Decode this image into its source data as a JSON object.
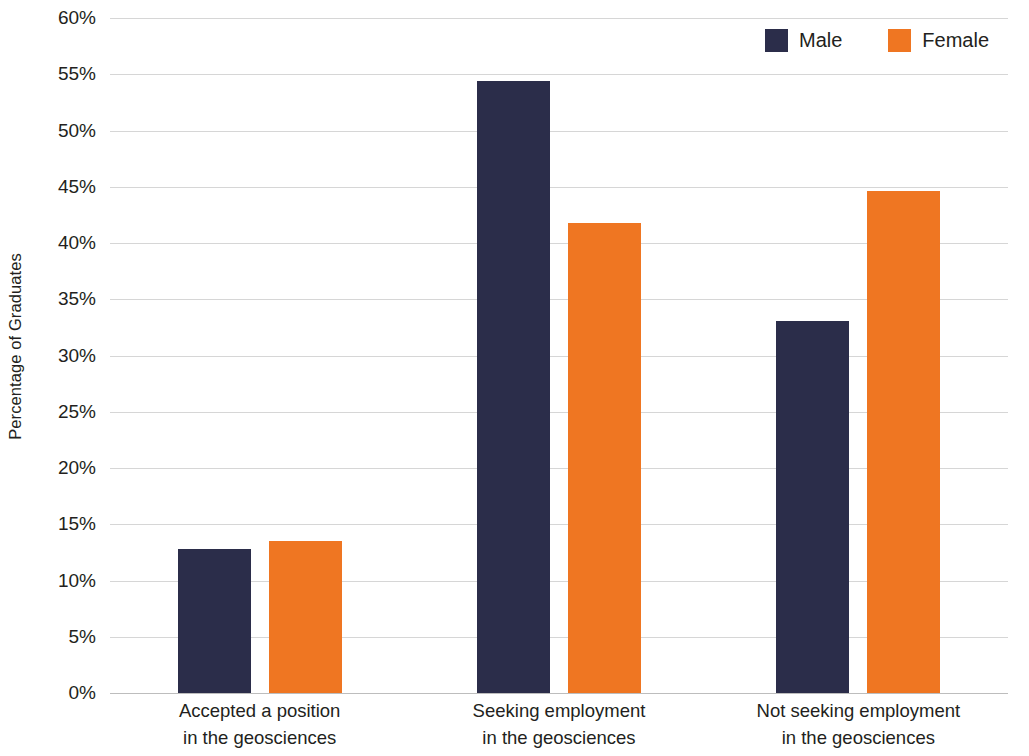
{
  "chart_data": {
    "type": "bar",
    "title": "",
    "xlabel": "",
    "ylabel": "Percentage of Graduates",
    "ylim": [
      0,
      60
    ],
    "ytick_step": 5,
    "ytick_labels": [
      "0%",
      "5%",
      "10%",
      "15%",
      "20%",
      "25%",
      "30%",
      "35%",
      "40%",
      "45%",
      "50%",
      "55%",
      "60%"
    ],
    "ytick_values": [
      0,
      5,
      10,
      15,
      20,
      25,
      30,
      35,
      40,
      45,
      50,
      55,
      60
    ],
    "grid": true,
    "legend_position": "top-right",
    "categories": [
      "Accepted a position in the geosciences",
      "Seeking employment in the geosciences",
      "Not seeking employment in the geosciences"
    ],
    "category_lines": [
      [
        "Accepted a position",
        "in the geosciences"
      ],
      [
        "Seeking employment",
        "in the geosciences"
      ],
      [
        "Not seeking employment",
        "in the geosciences"
      ]
    ],
    "series": [
      {
        "name": "Male",
        "color": "#2b2d4a",
        "values": [
          12.8,
          54.4,
          33.1
        ]
      },
      {
        "name": "Female",
        "color": "#ef7622",
        "values": [
          13.5,
          41.8,
          44.6
        ]
      }
    ]
  },
  "legend": {
    "items": [
      {
        "label": "Male",
        "color": "#2b2d4a"
      },
      {
        "label": "Female",
        "color": "#ef7622"
      }
    ]
  },
  "colors": {
    "male": "#2b2d4a",
    "female": "#ef7622",
    "gridline": "#d6d6d6",
    "text": "#231f20",
    "background": "#ffffff"
  }
}
